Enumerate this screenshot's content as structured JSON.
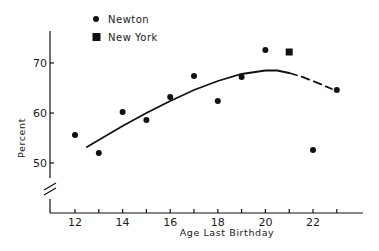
{
  "chart_data": {
    "type": "scatter",
    "title": "",
    "xlabel": "Age Last Birthday",
    "ylabel": "Percent",
    "x_ticks": [
      12,
      13,
      14,
      15,
      16,
      17,
      18,
      19,
      20,
      21,
      22,
      23
    ],
    "x_tick_labels": [
      "12",
      "",
      "14",
      "",
      "16",
      "",
      "18",
      "",
      "20",
      "",
      "22",
      ""
    ],
    "y_ticks": [
      50,
      60,
      70
    ],
    "y_tick_labels": [
      "50",
      "60",
      "70"
    ],
    "xlim": [
      11,
      24
    ],
    "ylim": [
      50,
      74
    ],
    "y_axis_break": true,
    "grid": false,
    "legend_position": "top-left",
    "series": [
      {
        "name": "Newton",
        "marker": "circle",
        "x": [
          12,
          13,
          14,
          15,
          16,
          17,
          18,
          19,
          20,
          22,
          23
        ],
        "y": [
          55.6,
          52.0,
          60.2,
          58.6,
          63.2,
          67.4,
          62.4,
          67.2,
          72.6,
          52.6,
          64.6
        ]
      },
      {
        "name": "New York",
        "marker": "square",
        "x": [
          21
        ],
        "y": [
          72.2
        ]
      },
      {
        "name": "Fitted curve",
        "type": "line",
        "style": "solid",
        "x": [
          12.5,
          13,
          14,
          15,
          16,
          17,
          18,
          19,
          20,
          20.5,
          21
        ],
        "y": [
          53.2,
          54.6,
          57.4,
          60.0,
          62.4,
          64.6,
          66.4,
          67.8,
          68.5,
          68.5,
          68.0
        ]
      },
      {
        "name": "Fitted curve (extrapolated)",
        "type": "line",
        "style": "dashed",
        "x": [
          21,
          21.5,
          22,
          22.5,
          22.8
        ],
        "y": [
          68.0,
          67.3,
          66.4,
          65.4,
          64.8
        ]
      }
    ]
  },
  "legend": {
    "items": [
      {
        "label": "Newton",
        "marker": "circle"
      },
      {
        "label": "New York",
        "marker": "square"
      }
    ]
  },
  "axes": {
    "x_title": "Age Last Birthday",
    "y_title": "Percent"
  },
  "colors": {
    "ink": "#111111",
    "background": "#ffffff"
  }
}
